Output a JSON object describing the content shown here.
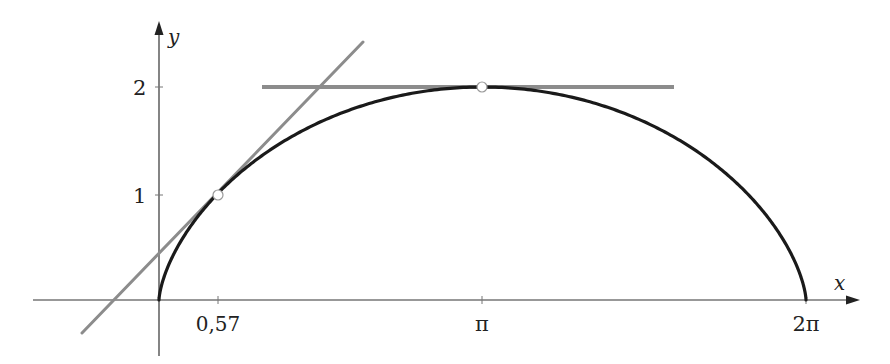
{
  "chart_data": {
    "type": "line",
    "title": "",
    "xlabel": "x",
    "ylabel": "y",
    "x_ticks": [
      {
        "value": 0.57,
        "label": "0,57"
      },
      {
        "value": 3.14159,
        "label": "π"
      },
      {
        "value": 6.28319,
        "label": "2π"
      }
    ],
    "y_ticks": [
      {
        "value": 1,
        "label": "1"
      },
      {
        "value": 2,
        "label": "2"
      }
    ],
    "series": [
      {
        "name": "cycloid",
        "color": "#1a1a1a",
        "points": [
          [
            0,
            0
          ],
          [
            0.02,
            0.19
          ],
          [
            0.08,
            0.59
          ],
          [
            0.23,
            0.82
          ],
          [
            0.57,
            1
          ],
          [
            1.0,
            1.35
          ],
          [
            1.5,
            1.63
          ],
          [
            2.0,
            1.84
          ],
          [
            2.5,
            1.96
          ],
          [
            3.14,
            2
          ],
          [
            3.78,
            1.96
          ],
          [
            4.28,
            1.84
          ],
          [
            4.78,
            1.63
          ],
          [
            5.28,
            1.35
          ],
          [
            5.71,
            1
          ],
          [
            6.05,
            0.59
          ],
          [
            6.26,
            0.19
          ],
          [
            6.28,
            0
          ]
        ]
      },
      {
        "name": "tangent-at-t-pi/2",
        "color": "#8c8c8c",
        "slope": 1,
        "through": [
          0.57,
          1
        ],
        "segment": [
          [
            -0.75,
            -0.31
          ],
          [
            1.98,
            2.41
          ]
        ]
      },
      {
        "name": "horizontal-tangent-at-top",
        "color": "#8c8c8c",
        "slope": 0,
        "through": [
          3.14,
          2
        ],
        "segment": [
          [
            1.0,
            2
          ],
          [
            5.0,
            2
          ]
        ]
      }
    ],
    "marked_points": [
      {
        "x": 0.57,
        "y": 1,
        "style": "open-circle"
      },
      {
        "x": 3.14159,
        "y": 2,
        "style": "open-circle"
      }
    ],
    "xlim": [
      -1.22,
      6.78
    ],
    "ylim": [
      -0.51,
      2.59
    ],
    "grid": false,
    "legend": "none"
  },
  "axes": {
    "x_label": "x",
    "y_label": "y",
    "x_tick_labels": [
      "0,57",
      "π",
      "2π"
    ],
    "y_tick_labels": [
      "1",
      "2"
    ]
  },
  "colors": {
    "curve": "#1a1a1a",
    "tangent": "#8c8c8c",
    "axis": "#333333"
  }
}
